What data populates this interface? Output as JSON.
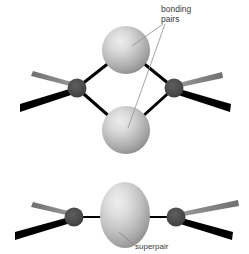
{
  "figure": {
    "background_color": "#ffffff",
    "width": 249,
    "height": 254,
    "panels": [
      {
        "id": "bonding-pairs-panel",
        "label_line1": "bonding",
        "label_line2": "pairs",
        "description": "Two gray spheres (electron bonding pairs) bridging two dark atoms, each atom with a gray wedge bond and a black wedge bond"
      },
      {
        "id": "superpair-panel",
        "label": "superpair",
        "description": "A single vertical gray ellipse (superpair) between two dark atoms, each atom with a gray wedge bond and a black wedge bond"
      }
    ]
  },
  "labels": {
    "bonding_line1": "bonding",
    "bonding_line2": "pairs",
    "superpair": "superpair"
  },
  "colors": {
    "background": "#ffffff",
    "sphere_highlight": "#e2e2e2",
    "sphere_mid": "#c2c2c2",
    "sphere_edge": "#8e8e8e",
    "atom_fill": "#4a4a4a",
    "atom_edge": "#3a3a3a",
    "bond_black": "#000000",
    "wedge_gray": "#8a8a8a",
    "leader_line": "#8a8a8a",
    "text": "#3a3a3a"
  }
}
